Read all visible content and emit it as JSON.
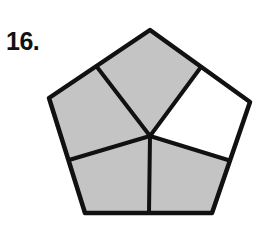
{
  "problem": {
    "number_label": "16."
  },
  "figure": {
    "shape": "regular pentagon",
    "total_parts": 5,
    "shaded_parts": 4,
    "unshaded_parts": 1,
    "colors": {
      "shaded": "#c4c4c4",
      "unshaded": "#ffffff",
      "stroke": "#111111"
    },
    "regions": [
      {
        "name": "top",
        "shaded": true
      },
      {
        "name": "upper-right",
        "shaded": false
      },
      {
        "name": "lower-right",
        "shaded": true
      },
      {
        "name": "lower-left",
        "shaded": true
      },
      {
        "name": "upper-left",
        "shaded": true
      }
    ]
  }
}
